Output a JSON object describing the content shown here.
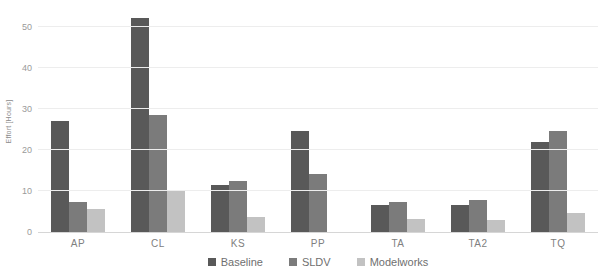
{
  "chart_data": {
    "type": "bar",
    "title": "",
    "xlabel": "",
    "ylabel": "Effort [Hours]",
    "categories": [
      "AP",
      "CL",
      "KS",
      "PP",
      "TA",
      "TA2",
      "TQ"
    ],
    "series": [
      {
        "name": "Baseline",
        "color": "#595959",
        "values": [
          27,
          52,
          11.5,
          24.5,
          6.6,
          6.5,
          22
        ]
      },
      {
        "name": "SLDV",
        "color": "#7b7b7b",
        "values": [
          7.3,
          28.5,
          12.3,
          14,
          7.3,
          7.8,
          24.7
        ]
      },
      {
        "name": "Modelworks",
        "color": "#c2c2c2",
        "values": [
          5.5,
          10,
          3.7,
          0,
          3.2,
          2.9,
          4.6
        ]
      }
    ],
    "y_ticks": [
      0,
      10,
      20,
      30,
      40,
      50
    ],
    "ylim": [
      0,
      55
    ],
    "grid": true,
    "legend_position": "bottom",
    "background_color": "#ffffff",
    "gridline_color": "#ededed",
    "axis_text_color": "#9a9a9a"
  }
}
